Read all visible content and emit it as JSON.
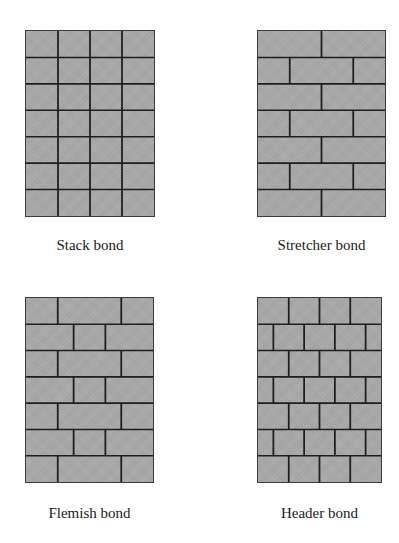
{
  "figure": {
    "colors": {
      "brick": "#a9a9a9",
      "mortar": "#1e1e1e",
      "background": "#ffffff"
    },
    "panels": [
      {
        "id": "stack",
        "caption": "Stack bond",
        "rows": 7,
        "row_pattern": [
          [
            0.25,
            0.5,
            0.75
          ]
        ],
        "x": 25,
        "y": 30,
        "w": 130,
        "h": 187
      },
      {
        "id": "stretcher",
        "caption": "Stretcher bond",
        "rows": 7,
        "row_pattern": [
          [
            0.5
          ],
          [
            0.25,
            0.75
          ]
        ],
        "x": 257,
        "y": 30,
        "w": 129,
        "h": 187
      },
      {
        "id": "flemish",
        "caption": "Flemish bond",
        "rows": 7,
        "row_pattern": [
          [
            0.25,
            0.75
          ],
          [
            0.375,
            0.625
          ]
        ],
        "x": 25,
        "y": 297,
        "w": 129,
        "h": 186
      },
      {
        "id": "header",
        "caption": "Header bond",
        "rows": 7,
        "row_pattern": [
          [
            0.25,
            0.5,
            0.75
          ],
          [
            0.125,
            0.375,
            0.625,
            0.875
          ]
        ],
        "x": 257,
        "y": 297,
        "w": 125,
        "h": 186
      }
    ]
  }
}
